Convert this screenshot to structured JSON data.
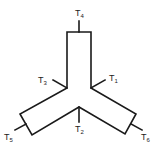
{
  "diagram": {
    "type": "Y-shaped three-arm body with terminals",
    "terminals": [
      {
        "id": "T1",
        "base": "T",
        "sub": "1"
      },
      {
        "id": "T2",
        "base": "T",
        "sub": "2"
      },
      {
        "id": "T3",
        "base": "T",
        "sub": "3"
      },
      {
        "id": "T4",
        "base": "T",
        "sub": "4"
      },
      {
        "id": "T5",
        "base": "T",
        "sub": "5"
      },
      {
        "id": "T6",
        "base": "T",
        "sub": "6"
      }
    ]
  }
}
